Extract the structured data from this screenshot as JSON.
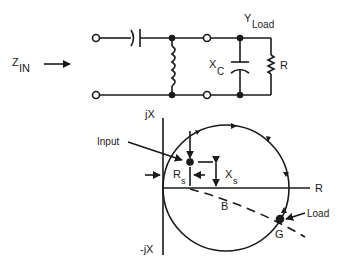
{
  "circuit": {
    "zin_label": "Z",
    "zin_sub": "IN",
    "yload_label": "Y",
    "yload_sub": "Load",
    "xc_label": "X",
    "xc_sub": "C",
    "r_label": "R"
  },
  "chart": {
    "jx_label": "jX",
    "neg_jx_label": "-jX",
    "r_axis_label": "R",
    "input_label": "Input",
    "rs_label": "R",
    "rs_sub": "s",
    "xs_label": "X",
    "xs_sub": "s",
    "b_label": "B",
    "g_label": "G",
    "load_label": "Load"
  },
  "colors": {
    "ink": "#1a1a1a",
    "background": "#ffffff"
  }
}
